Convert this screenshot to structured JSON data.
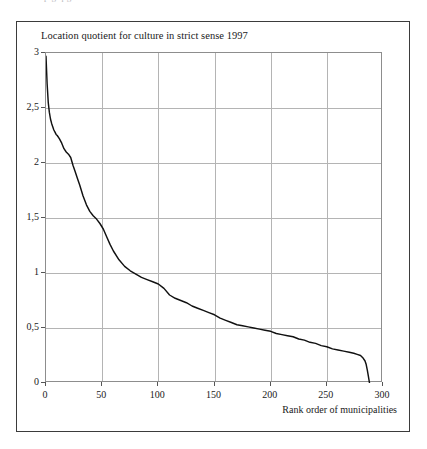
{
  "figure": {
    "clipped_top_text": "p g q g",
    "title": "Location quotient for culture in strict sense 1997",
    "xaxis_label": "Rank order of municipalities"
  },
  "chart_data": {
    "type": "line",
    "title": "Location quotient for culture in strict sense 1997",
    "xlabel": "Rank order of municipalities",
    "ylabel": "",
    "xlim": [
      0,
      300
    ],
    "ylim": [
      0,
      3
    ],
    "grid": true,
    "legend": null,
    "decimal_separator": ",",
    "xticks": [
      "0",
      "50",
      "100",
      "150",
      "200",
      "250",
      "300"
    ],
    "xtick_values": [
      0,
      50,
      100,
      150,
      200,
      250,
      300
    ],
    "yticks": [
      "0",
      "0,5",
      "1",
      "1,5",
      "2",
      "2,5",
      "3"
    ],
    "ytick_values": [
      0,
      0.5,
      1,
      1.5,
      2,
      2.5,
      3
    ],
    "series": [
      {
        "name": "Location quotient for culture in strict sense 1997",
        "color": "#111111",
        "x": [
          0,
          1,
          2,
          3,
          4,
          5,
          6,
          7,
          8,
          9,
          10,
          12,
          14,
          16,
          18,
          20,
          22,
          24,
          26,
          28,
          30,
          33,
          36,
          39,
          42,
          45,
          48,
          51,
          54,
          57,
          60,
          65,
          70,
          75,
          80,
          85,
          90,
          95,
          100,
          105,
          110,
          115,
          120,
          125,
          130,
          135,
          140,
          145,
          150,
          155,
          160,
          165,
          170,
          175,
          180,
          185,
          190,
          195,
          200,
          205,
          210,
          215,
          220,
          225,
          230,
          235,
          240,
          245,
          250,
          255,
          260,
          265,
          270,
          274,
          277,
          280,
          282,
          284,
          285,
          286,
          287,
          288
        ],
        "y": [
          2.97,
          2.72,
          2.55,
          2.46,
          2.4,
          2.36,
          2.33,
          2.3,
          2.28,
          2.26,
          2.25,
          2.22,
          2.18,
          2.13,
          2.1,
          2.08,
          2.05,
          1.98,
          1.92,
          1.86,
          1.8,
          1.7,
          1.62,
          1.56,
          1.52,
          1.49,
          1.45,
          1.4,
          1.33,
          1.26,
          1.2,
          1.12,
          1.06,
          1.02,
          0.99,
          0.96,
          0.94,
          0.92,
          0.9,
          0.86,
          0.8,
          0.77,
          0.75,
          0.73,
          0.7,
          0.68,
          0.66,
          0.64,
          0.62,
          0.59,
          0.57,
          0.55,
          0.53,
          0.52,
          0.51,
          0.5,
          0.49,
          0.48,
          0.47,
          0.45,
          0.44,
          0.43,
          0.42,
          0.4,
          0.39,
          0.37,
          0.36,
          0.34,
          0.33,
          0.31,
          0.3,
          0.29,
          0.28,
          0.27,
          0.26,
          0.25,
          0.23,
          0.2,
          0.17,
          0.12,
          0.06,
          0.0
        ]
      }
    ]
  }
}
